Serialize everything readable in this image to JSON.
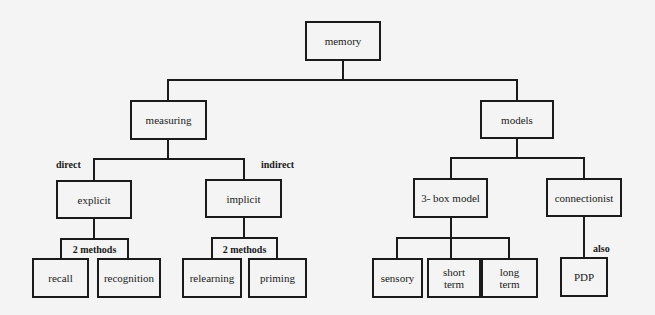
{
  "diagram": {
    "type": "hierarchy-tree",
    "root": "memory",
    "nodes": {
      "memory": "memory",
      "measuring": "measuring",
      "models": "models",
      "explicit": "explicit",
      "implicit": "implicit",
      "three_box_model": "3- box model",
      "connectionist": "connectionist",
      "recall": "recall",
      "recognition": "recognition",
      "relearning": "relearning",
      "priming": "priming",
      "sensory": "sensory",
      "short_term": "short term",
      "long_term": "long term",
      "pdp": "PDP"
    },
    "group_tags": {
      "explicit_methods": "2 methods",
      "implicit_methods": "2 methods"
    },
    "edge_labels": {
      "direct": "direct",
      "indirect": "indirect",
      "also": "also"
    },
    "edges": [
      [
        "memory",
        "measuring"
      ],
      [
        "memory",
        "models"
      ],
      [
        "measuring",
        "explicit"
      ],
      [
        "measuring",
        "implicit"
      ],
      [
        "models",
        "3- box model"
      ],
      [
        "models",
        "connectionist"
      ],
      [
        "explicit",
        "recall"
      ],
      [
        "explicit",
        "recognition"
      ],
      [
        "implicit",
        "relearning"
      ],
      [
        "implicit",
        "priming"
      ],
      [
        "3- box model",
        "sensory"
      ],
      [
        "3- box model",
        "short term"
      ],
      [
        "3- box model",
        "long term"
      ],
      [
        "connectionist",
        "PDP"
      ]
    ]
  }
}
